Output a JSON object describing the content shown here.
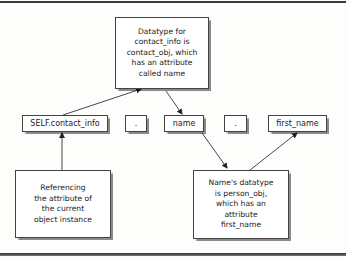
{
  "diagram": {
    "type": "annotated-expression",
    "expression_tokens": [
      {
        "id": "self_contact_info",
        "label": "SELF.contact_info"
      },
      {
        "id": "dot1",
        "label": "."
      },
      {
        "id": "name",
        "label": "name"
      },
      {
        "id": "dot2",
        "label": "."
      },
      {
        "id": "first_name",
        "label": "first_name"
      }
    ],
    "annotations": {
      "top": "Datatype for\ncontact_info is\ncontact_obj, which\nhas an attribute\ncalled name",
      "bottom_left": "Referencing\nthe attribute of\nthe current\nobject instance",
      "bottom_right": "Name's datatype\nis person_obj,\nwhich has an\nattribute\nfirst_name"
    },
    "edges": [
      {
        "from": "self_contact_info",
        "to": "annotation_top"
      },
      {
        "from": "annotation_top",
        "to": "name"
      },
      {
        "from": "annotation_bottom_left",
        "to": "self_contact_info"
      },
      {
        "from": "name",
        "to": "annotation_bottom_right"
      },
      {
        "from": "annotation_bottom_right",
        "to": "first_name"
      }
    ]
  }
}
